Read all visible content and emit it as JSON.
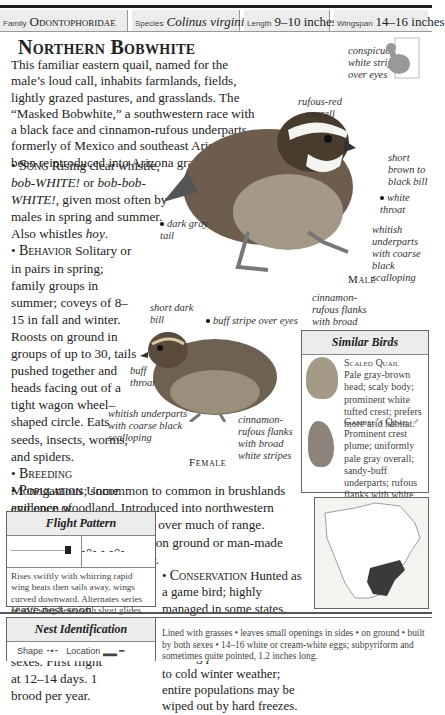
{
  "header": {
    "family_label": "Family",
    "family": "Odontophoridae",
    "species_label": "Species",
    "species": "Colinus virginianus",
    "length_label": "Length",
    "length": "9–10 inches",
    "wingspan_label": "Wingspan",
    "wingspan": "14–16 inches"
  },
  "title": "Northern Bobwhite",
  "intro": "This familiar eastern quail, named for the male’s loud call, inhabits farmlands, fields, lightly grazed pastures, and grasslands. The “Masked Bobwhite,” a southwestern race with a black face and cinnamon-rufous underparts, formerly of Mexico and southeast Arizona, has been reintroduced into Arizona grasslands.",
  "sections": {
    "song": {
      "head": "Song",
      "text1": " Rising clear whistle, ",
      "it1": "bob-WHITE!",
      "text2": " or ",
      "it2": "bob-bob-WHITE!",
      "text3": ", given most often by males in spring and summer. Also whistles ",
      "it3": "hoy",
      "text4": "."
    },
    "behavior": {
      "head": "Behavior",
      "text": " Solitary or in pairs in spring; family groups in summer; coveys of 8–15 in fall and winter. Roosts on ground in groups of up to 30, tails pushed together and heads facing out of a tight wagon wheel–shaped circle. Eats seeds, insects, worms, and spiders."
    },
    "breeding": {
      "head": "Breeding",
      "text": "Monogamous; some evidence of polygamy."
    },
    "nesting": {
      "head": "Nesting",
      "text": "Incubation 23–24 days by both sexes. Young leave nest soon after hatching; tended by both sexes. First flight at 12–14 days. 1 brood per year."
    },
    "population": {
      "head": "Population",
      "text": "  Uncommon to common in brushlands and open woodland. Introduced into northwestern US. Significantly declining over much of range."
    },
    "feeders": {
      "head": "Feeders",
      "text": " Scattered grains on ground or man-made permanent sources of water."
    },
    "conservation": {
      "head": "Conservation",
      "text": " Hunted as a game bird; highly managed in some states. Decline may be due to habitat loss and changes in farming practices. Sensitive to cold winter weather; entire populations may be wiped out by hard freezes."
    }
  },
  "male_labels": {
    "stripe": "conspicuous white stripe over eyes",
    "rufous": "rufous-red overall",
    "bill": "short brown to black bill",
    "throat": "white throat",
    "tail": "dark gray tail",
    "underparts": "whitish underparts with coarse black scalloping",
    "flanks": "cinnamon-rufous flanks with broad white stripes",
    "sex": "Male"
  },
  "female_labels": {
    "bill": "short dark bill",
    "stripe": "buff stripe over eyes",
    "throat": "buff throat",
    "underparts": "whitish underparts with coarse black scalloping",
    "flanks": "cinnamon-rufous flanks with broad white stripes",
    "sex": "Female"
  },
  "similar": {
    "title": "Similar Birds",
    "birds": [
      {
        "name": "Scaled Quail",
        "desc": "Pale gray-brown head; scaly body; prominent white tufted crest; prefers more arid habitat."
      },
      {
        "name": "Gambel’s Quail",
        "symbol": "♂",
        "desc": "Prominent crest plume; uniformly pale gray overall; sandy-buff underparts; rufous flanks with white streaks • inhabits desert scrublands of the Southwest."
      }
    ]
  },
  "flight": {
    "title": "Flight Pattern",
    "desc": "Rises swiftly with whirring rapid wing beats then sails away, wings curved downward. Alternates series of stiff wing beats with short glides on drooping wing tips."
  },
  "nest": {
    "title": "Nest Identification",
    "shape_label": "Shape",
    "location_label": "Location",
    "desc": "Lined with grasses • leaves small openings in sides • on ground • built by both sexes • 14–16 white or cream-white eggs; subpyriform and sometimes quite pointed, 1.2 inches long."
  },
  "colors": {
    "range": "#3a3a3a",
    "header_bg": "#ececec"
  }
}
